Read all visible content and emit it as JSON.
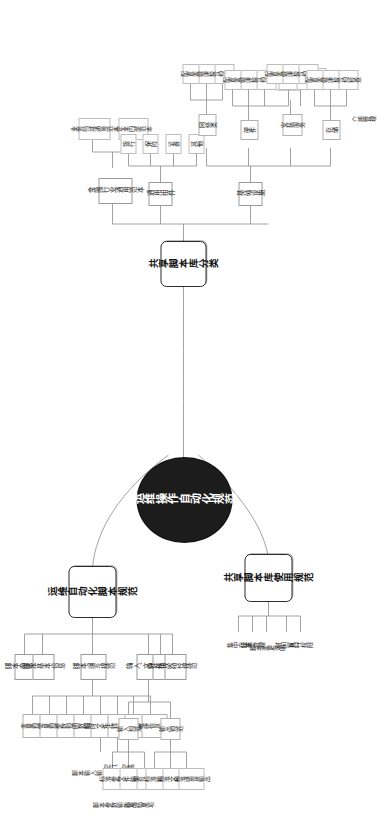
{
  "diagram": {
    "title": "运维操作自动化规范",
    "type": "mindmap",
    "orientation": "rotated-90-ccw",
    "colors": {
      "center_fill": "#1c1c1c",
      "center_text": "#ffffff",
      "branch_border": "#2b2b2b",
      "link": "#8c8c8c",
      "node_border": "#9a9a9a",
      "background": "#ffffff"
    }
  },
  "center": {
    "label": "运维操作自动化规范"
  },
  "branches": [
    {
      "id": "script-spec",
      "label": "运维自动化脚本规范",
      "children": [
        {
          "label": "脚本命名规范"
        },
        {
          "label": "脚本基本信息"
        },
        {
          "label": "脚本编写规范",
          "children": [
            {
              "label": "变量规范"
            },
            {
              "label": "常量规范"
            },
            {
              "label": "参数规范"
            },
            {
              "label": "函数规范"
            },
            {
              "label": "临时文件命名规范"
            },
            {
              "label": "注释规范"
            },
            {
              "label": "脚本格式规范"
            },
            {
              "label": "敏感信息处理"
            }
          ]
        },
        {
          "label": "输入、输出规范",
          "children": [
            {
              "label": "输入规范",
              "children": [
                {
                  "label": "标准参数输入"
                },
                {
                  "label": "文件输入"
                },
                {
                  "label": "编号码输出"
                }
              ]
            },
            {
              "label": "输出规范",
              "children": [
                {
                  "label": "标准输出"
                },
                {
                  "label": "标准文件输出"
                },
                {
                  "label": "标准错误输出"
                }
              ]
            }
          ]
        },
        {
          "label": "文件格式规范"
        },
        {
          "label": "存放路径规范"
        }
      ],
      "notes": [
        {
          "label": "脚本输入输出内容注释"
        },
        {
          "label": "空行、空格"
        },
        {
          "label": "脚本参数输入项"
        },
        {
          "label": "输出结果项"
        }
      ]
    },
    {
      "id": "shared-usage",
      "label": "共享脚本库使用规范",
      "children": [
        {
          "label": "集中存放"
        },
        {
          "label": "版本管理"
        },
        {
          "label": "脚本变更说明"
        },
        {
          "label": "时间窗口"
        },
        {
          "label": "执行权限"
        }
      ]
    },
    {
      "id": "shared-category",
      "label": "共享脚本库分类",
      "children": [
        {
          "label": "金融行业通用范本",
          "children": [
            {
              "label": "业务领域通用范本"
            },
            {
              "label": "企业内部范本"
            }
          ]
        },
        {
          "label": "通用组件",
          "children": [
            {
              "label": "银行"
            },
            {
              "label": "保险"
            },
            {
              "label": "证券"
            },
            {
              "label": "其他"
            }
          ]
        },
        {
          "label": "基础设施",
          "children": [
            {
              "label": "网络类",
              "children": [
                {
                  "label": "配置变更"
                },
                {
                  "label": "健康检查"
                },
                {
                  "label": "合规检查"
                }
              ]
            },
            {
              "label": "硬件",
              "children": [
                {
                  "label": "配置变更"
                },
                {
                  "label": "健康检查"
                },
                {
                  "label": "合规检查"
                },
                {
                  "label": "RAID 连接检查"
                },
                {
                  "label": "热插拔点检查"
                }
              ]
            },
            {
              "label": "安装服务",
              "children": [
                {
                  "label": "配置变更"
                },
                {
                  "label": "健康检查"
                },
                {
                  "label": "合规检查"
                }
              ]
            },
            {
              "label": "存储",
              "children": [
                {
                  "label": "配置变更"
                },
                {
                  "label": "健康检查"
                },
                {
                  "label": "合规检查"
                }
              ]
            },
            {
              "label": "介质管理"
            },
            {
              "label": "RAID 连接检查"
            },
            {
              "label": "热插拔点检查"
            }
          ]
        }
      ]
    }
  ]
}
